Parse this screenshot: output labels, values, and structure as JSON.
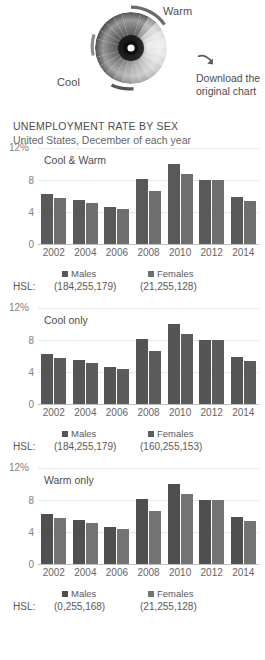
{
  "header": {
    "wheel_label_warm": "Warm",
    "wheel_label_cool": "Cool",
    "download_line1": "Download the",
    "download_line2": "original chart",
    "arrow_icon": "curved-arrow-down-right-icon",
    "wheel_icon": "color-wheel-grayscale-icon"
  },
  "titles": {
    "main": "UNEMPLOYMENT RATE BY SEX",
    "sub": "United States, December of each year"
  },
  "legend": {
    "males_label": "Males",
    "females_label": "Females",
    "hsl_key": "HSL:"
  },
  "chart_data": [
    {
      "type": "bar",
      "title": "Cool & Warm",
      "panel_caption": "Cool & Warm",
      "xlabel": "",
      "ylabel": "",
      "top_axis_label": "12%",
      "ytick_labels": [
        "8",
        "4",
        "0"
      ],
      "yticks": [
        8,
        4,
        0
      ],
      "ylim": [
        0,
        12
      ],
      "grid": true,
      "legend_position": "bottom",
      "categories": [
        "2002",
        "2004",
        "2006",
        "2008",
        "2010",
        "2012",
        "2014"
      ],
      "series": [
        {
          "name": "Males",
          "hsl": "(184,255,179)",
          "color": "#595959",
          "values": [
            6.2,
            5.5,
            4.6,
            8.1,
            10.0,
            8.0,
            5.9
          ]
        },
        {
          "name": "Females",
          "hsl": "(21,255,128)",
          "color": "#6e6e6e",
          "values": [
            5.7,
            5.1,
            4.4,
            6.6,
            8.7,
            8.0,
            5.4
          ]
        }
      ]
    },
    {
      "type": "bar",
      "title": "Cool only",
      "panel_caption": "Cool only",
      "xlabel": "",
      "ylabel": "",
      "top_axis_label": "12%",
      "ytick_labels": [
        "8",
        "4",
        "0"
      ],
      "yticks": [
        8,
        4,
        0
      ],
      "ylim": [
        0,
        12
      ],
      "grid": true,
      "legend_position": "bottom",
      "categories": [
        "2002",
        "2004",
        "2006",
        "2008",
        "2010",
        "2012",
        "2014"
      ],
      "series": [
        {
          "name": "Males",
          "hsl": "(184,255,179)",
          "color": "#555555",
          "values": [
            6.2,
            5.5,
            4.6,
            8.1,
            10.0,
            8.0,
            5.9
          ]
        },
        {
          "name": "Females",
          "hsl": "(160,255,153)",
          "color": "#5c5c5c",
          "values": [
            5.7,
            5.1,
            4.4,
            6.6,
            8.7,
            8.0,
            5.4
          ]
        }
      ]
    },
    {
      "type": "bar",
      "title": "Warm only",
      "panel_caption": "Warm only",
      "xlabel": "",
      "ylabel": "",
      "top_axis_label": "12%",
      "ytick_labels": [
        "8",
        "4",
        "0"
      ],
      "yticks": [
        8,
        4,
        0
      ],
      "ylim": [
        0,
        12
      ],
      "grid": true,
      "legend_position": "bottom",
      "categories": [
        "2002",
        "2004",
        "2006",
        "2008",
        "2010",
        "2012",
        "2014"
      ],
      "series": [
        {
          "name": "Males",
          "hsl": "(0,255,168)",
          "color": "#4f4f4f",
          "values": [
            6.2,
            5.5,
            4.6,
            8.1,
            10.0,
            8.0,
            5.9
          ]
        },
        {
          "name": "Females",
          "hsl": "(21,255,128)",
          "color": "#737373",
          "values": [
            5.7,
            5.1,
            4.4,
            6.6,
            8.7,
            8.0,
            5.4
          ]
        }
      ]
    }
  ]
}
